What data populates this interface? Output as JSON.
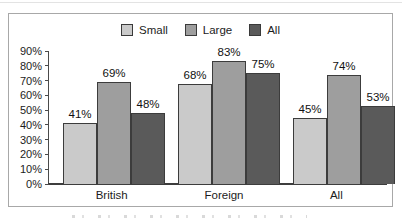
{
  "chart_data": {
    "type": "bar",
    "title": "",
    "categories": [
      "British",
      "Foreign",
      "All"
    ],
    "series": [
      {
        "name": "Small",
        "color": "#cacaca",
        "values": [
          41,
          68,
          45
        ]
      },
      {
        "name": "Large",
        "color": "#9e9e9e",
        "values": [
          69,
          83,
          74
        ]
      },
      {
        "name": "All",
        "color": "#5a5a5a",
        "values": [
          48,
          75,
          53
        ]
      }
    ],
    "value_suffix": "%",
    "ylim": [
      0,
      90
    ],
    "ytick_step": 10,
    "yticks": [
      "90%",
      "80%",
      "70%",
      "60%",
      "50%",
      "40%",
      "30%",
      "20%",
      "10%",
      "0%"
    ],
    "xlabel": "",
    "ylabel": "",
    "grid": false,
    "legend_position": "top-center",
    "bar_border_color": "#3c3c3c",
    "frame_border_color": "#a8a8a8"
  }
}
